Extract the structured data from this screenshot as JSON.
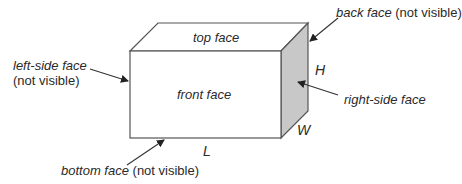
{
  "figure": {
    "faces": {
      "top": "top face",
      "front": "front face",
      "right": "right-side face",
      "left": "left-side face",
      "left_note": "(not visible)",
      "back": "back face",
      "back_note": "(not visible)",
      "bottom": "bottom face",
      "bottom_note": "(not visible)"
    },
    "dimensions": {
      "height": "H",
      "length": "L",
      "width": "W"
    },
    "colors": {
      "stroke": "#555555",
      "right_face_fill": "#c8c8c8"
    }
  }
}
